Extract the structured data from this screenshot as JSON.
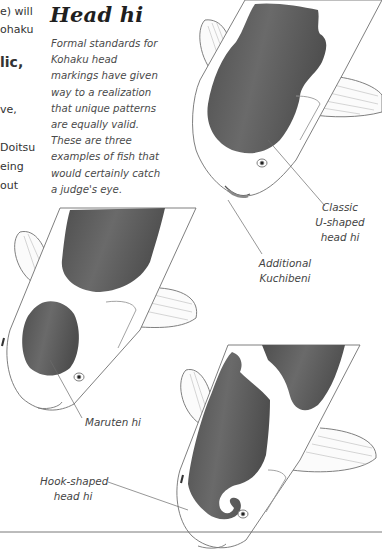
{
  "left_column_fragments": [
    {
      "text": "e) will",
      "top": 2
    },
    {
      "text": "ohaku",
      "top": 20
    },
    {
      "text": "lic,",
      "top": 55,
      "bold": true
    },
    {
      "text": "ve,",
      "top": 100
    },
    {
      "text": "Doitsu",
      "top": 138
    },
    {
      "text": "eing",
      "top": 157
    },
    {
      "text": "out",
      "top": 176
    }
  ],
  "section": {
    "title": "Head hi",
    "intro_lines": [
      "Formal standards for",
      "Kohaku head",
      "markings have given",
      "way to a realization",
      "that unique patterns",
      "are equally valid.",
      "These are three",
      "examples of fish that",
      "would certainly catch",
      "a judge's eye."
    ]
  },
  "callouts": {
    "classic": [
      "Classic",
      "U-shaped",
      "head hi"
    ],
    "kuchibeni": [
      "Additional",
      "Kuchibeni"
    ],
    "maruten": [
      "Maruten hi"
    ],
    "hook": [
      "Hook-shaped",
      "head hi"
    ]
  },
  "colors": {
    "marking": "#5a5a5a",
    "outline": "#777777",
    "text": "#444444"
  }
}
